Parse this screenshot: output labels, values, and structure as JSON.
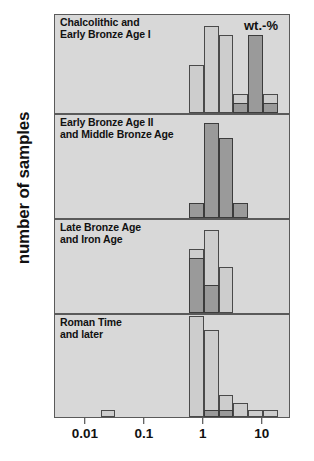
{
  "figure": {
    "ylabel": "number of samples",
    "xunit": "wt.-%",
    "xticks": [
      "0.01",
      "0.1",
      "1",
      "10"
    ],
    "xtick_values": [
      0.01,
      0.1,
      1,
      10
    ],
    "colors": {
      "panel_background": "#d8d8d8",
      "light_series": "#cdcdcd",
      "dark_series": "#9a9a9a",
      "outline": "#4a4a4a",
      "text": "#111111"
    }
  },
  "chart_data": {
    "type": "bar",
    "title": "",
    "subtitle": "",
    "xlabel": "wt.-%",
    "ylabel": "number of samples",
    "xscale": "log",
    "xlim": [
      0.003,
      30
    ],
    "grid": false,
    "legend": "none",
    "annotations": [],
    "bin_edges_log": [
      0.003,
      0.0056,
      0.01,
      0.0178,
      0.0316,
      0.0562,
      0.1,
      0.178,
      0.316,
      0.562,
      1.0,
      1.78,
      3.16,
      5.62,
      10.0,
      17.8,
      30.0
    ],
    "panels": [
      {
        "label": "Chalcolithic and\nEarly Bronze Age I",
        "label_lines": [
          "Chalcolithic and",
          "Early Bronze Age I"
        ],
        "yticks": [
          4,
          8
        ],
        "ylim": [
          0,
          10
        ],
        "series": [
          {
            "name": "light",
            "bins": [
              {
                "x_lo": 0.562,
                "x_hi": 1.0,
                "value": 5
              },
              {
                "x_lo": 1.0,
                "x_hi": 1.78,
                "value": 9
              },
              {
                "x_lo": 1.78,
                "x_hi": 3.16,
                "value": 8
              },
              {
                "x_lo": 3.16,
                "x_hi": 5.62,
                "value": 2
              },
              {
                "x_lo": 5.62,
                "x_hi": 10.0,
                "value": 8
              },
              {
                "x_lo": 10.0,
                "x_hi": 17.8,
                "value": 2
              }
            ]
          },
          {
            "name": "dark",
            "bins": [
              {
                "x_lo": 3.16,
                "x_hi": 5.62,
                "value": 1
              },
              {
                "x_lo": 5.62,
                "x_hi": 10.0,
                "value": 8
              },
              {
                "x_lo": 10.0,
                "x_hi": 17.8,
                "value": 1
              }
            ]
          }
        ]
      },
      {
        "label": "Early Bronze Age II\nand Middle Bronze Age",
        "label_lines": [
          "Early Bronze Age II",
          "and Middle Bronze Age"
        ],
        "yticks": [
          4,
          8,
          12
        ],
        "ylim": [
          0,
          14
        ],
        "series": [
          {
            "name": "light",
            "bins": []
          },
          {
            "name": "dark",
            "bins": [
              {
                "x_lo": 0.562,
                "x_hi": 1.0,
                "value": 2
              },
              {
                "x_lo": 1.0,
                "x_hi": 1.78,
                "value": 13
              },
              {
                "x_lo": 1.78,
                "x_hi": 3.16,
                "value": 11
              },
              {
                "x_lo": 3.16,
                "x_hi": 5.62,
                "value": 2
              }
            ]
          }
        ]
      },
      {
        "label": "Late Bronze Age\nand Iron Age",
        "label_lines": [
          "Late Bronze Age",
          "and Iron Age"
        ],
        "yticks": [
          4,
          8
        ],
        "ylim": [
          0,
          10
        ],
        "series": [
          {
            "name": "light",
            "bins": [
              {
                "x_lo": 0.562,
                "x_hi": 1.0,
                "value": 7
              },
              {
                "x_lo": 1.0,
                "x_hi": 1.78,
                "value": 9
              },
              {
                "x_lo": 1.78,
                "x_hi": 3.16,
                "value": 5
              }
            ]
          },
          {
            "name": "dark",
            "bins": [
              {
                "x_lo": 0.562,
                "x_hi": 1.0,
                "value": 6
              },
              {
                "x_lo": 1.0,
                "x_hi": 1.78,
                "value": 3
              }
            ]
          }
        ]
      },
      {
        "label": "Roman Time\nand later",
        "label_lines": [
          "Roman Time",
          "and later"
        ],
        "yticks": [
          4,
          8,
          12
        ],
        "ylim": [
          0,
          14
        ],
        "series": [
          {
            "name": "light",
            "bins": [
              {
                "x_lo": 0.0178,
                "x_hi": 0.0316,
                "value": 1
              },
              {
                "x_lo": 0.562,
                "x_hi": 1.0,
                "value": 14
              },
              {
                "x_lo": 1.0,
                "x_hi": 1.78,
                "value": 12
              },
              {
                "x_lo": 1.78,
                "x_hi": 3.16,
                "value": 3
              },
              {
                "x_lo": 3.16,
                "x_hi": 5.62,
                "value": 2
              },
              {
                "x_lo": 5.62,
                "x_hi": 10.0,
                "value": 1
              },
              {
                "x_lo": 10.0,
                "x_hi": 17.8,
                "value": 1
              }
            ]
          },
          {
            "name": "dark",
            "bins": [
              {
                "x_lo": 1.0,
                "x_hi": 1.78,
                "value": 1
              },
              {
                "x_lo": 1.78,
                "x_hi": 3.16,
                "value": 1
              }
            ]
          }
        ]
      }
    ]
  }
}
